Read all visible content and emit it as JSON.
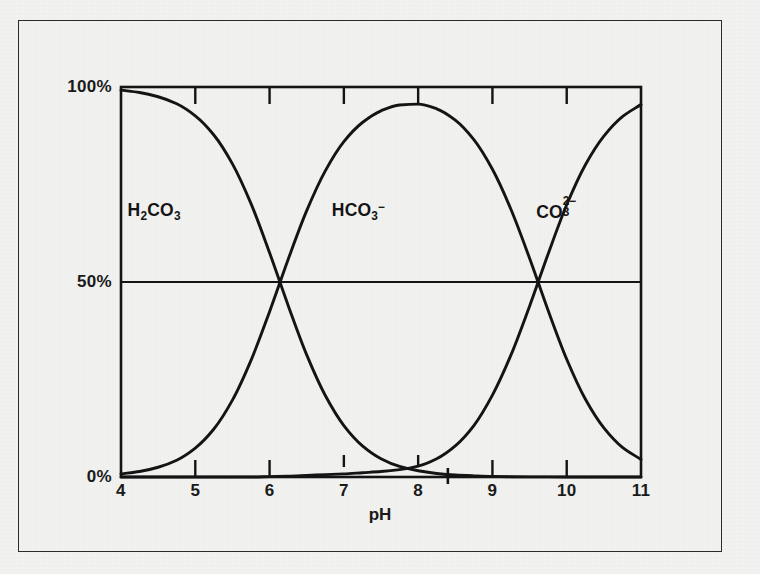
{
  "figure": {
    "background_color": "#f1f1ef",
    "ink_color": "#141414",
    "outer_frame": true
  },
  "axes": {
    "x_title": "pH",
    "y_ticks": [
      {
        "label": "100%",
        "value": 100
      },
      {
        "label": "50%",
        "value": 50
      },
      {
        "label": "0%",
        "value": 0
      }
    ],
    "x_ticks": [
      {
        "label": "4",
        "value": 4
      },
      {
        "label": "5",
        "value": 5
      },
      {
        "label": "6",
        "value": 6
      },
      {
        "label": "7",
        "value": 7
      },
      {
        "label": "8",
        "value": 8
      },
      {
        "label": "9",
        "value": 9
      },
      {
        "label": "10",
        "value": 10
      },
      {
        "label": "11",
        "value": 11
      }
    ]
  },
  "species": [
    {
      "id": "carbonic-acid",
      "label_html": "H<sub>2</sub>CO<sub>3</sub>",
      "label_text": "H2CO3",
      "x": 4.6,
      "y": 68
    },
    {
      "id": "bicarbonate",
      "label_html": "HCO<sub>3</sub><sup>&minus;</sup>",
      "label_text": "HCO3-",
      "x": 7.35,
      "y": 68
    },
    {
      "id": "carbonate",
      "label_html": "CO<span class=\"stack\"><sup>2&minus;</sup><sub>3</sub></span>",
      "label_text": "CO3 2-",
      "x": 10.1,
      "y": 68
    }
  ],
  "chart_data": {
    "type": "line",
    "title": "",
    "subtitle": "",
    "xlabel": "pH",
    "ylabel": "",
    "xlim": [
      4,
      11
    ],
    "ylim": [
      0,
      100
    ],
    "grid": false,
    "legend": "inline-annotations",
    "y_unit": "%",
    "gridlines": [
      {
        "axis": "y",
        "value": 50,
        "style": "solid"
      }
    ],
    "crossings": [
      {
        "pH": 5.9,
        "percent": 50,
        "species_pair": [
          "H2CO3",
          "HCO3-"
        ],
        "note": "pKa1"
      },
      {
        "pH": 8.9,
        "percent": 50,
        "species_pair": [
          "HCO3-",
          "CO3 2-"
        ],
        "note": "pKa2"
      }
    ],
    "annotations": [
      {
        "type": "tick-mark",
        "pH": 7.0,
        "position": "above-axis"
      },
      {
        "type": "tick-mark",
        "pH": 8.0,
        "position": "above-axis"
      },
      {
        "type": "tick-mark",
        "pH": 8.4,
        "position": "through-axis"
      }
    ],
    "x": [
      4.0,
      4.25,
      4.5,
      4.75,
      5.0,
      5.25,
      5.5,
      5.75,
      6.0,
      6.25,
      6.5,
      6.75,
      7.0,
      7.25,
      7.5,
      7.75,
      8.0,
      8.25,
      8.5,
      8.75,
      9.0,
      9.25,
      9.5,
      9.75,
      10.0,
      10.25,
      10.5,
      10.75,
      11.0
    ],
    "series": [
      {
        "name": "H2CO3",
        "label": "H2CO3",
        "values": [
          99.2,
          98.6,
          97.5,
          95.7,
          92.6,
          87.7,
          80.3,
          70.1,
          57.5,
          44.0,
          31.3,
          20.9,
          13.2,
          8.0,
          4.7,
          2.7,
          1.6,
          0.9,
          0.5,
          0.3,
          0.15,
          0.08,
          0.04,
          0.02,
          0.01,
          0.0,
          0.0,
          0.0,
          0.0
        ]
      },
      {
        "name": "HCO3-",
        "label": "HCO3-",
        "values": [
          0.8,
          1.4,
          2.5,
          4.3,
          7.4,
          12.3,
          19.7,
          29.9,
          42.4,
          55.8,
          68.3,
          78.5,
          86.0,
          90.9,
          93.9,
          95.4,
          95.6,
          94.4,
          91.5,
          86.5,
          78.9,
          68.6,
          56.1,
          42.7,
          30.2,
          20.0,
          12.6,
          7.6,
          4.5
        ]
      },
      {
        "name": "CO3 2-",
        "label": "CO3 2-",
        "values": [
          0.0,
          0.0,
          0.0,
          0.0,
          0.0,
          0.0,
          0.0,
          0.0,
          0.1,
          0.2,
          0.4,
          0.6,
          0.8,
          1.1,
          1.4,
          1.9,
          2.8,
          4.7,
          8.0,
          13.2,
          21.0,
          31.3,
          43.8,
          57.2,
          69.8,
          80.0,
          87.4,
          92.4,
          95.5
        ]
      }
    ]
  }
}
